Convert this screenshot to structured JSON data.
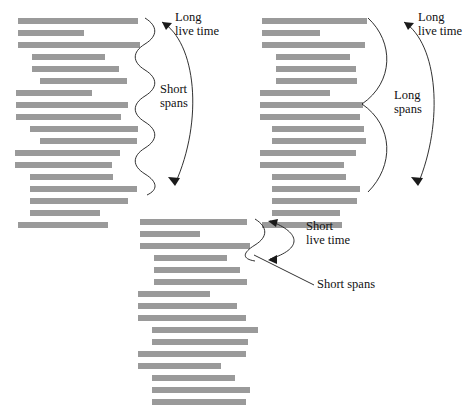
{
  "figure": {
    "background_color": "#ffffff",
    "bar_color": "#9a9a9a",
    "line_color": "#1a1a1a",
    "text_color": "#111111"
  },
  "panels": [
    {
      "id": "panel-long-short",
      "name": "long-live-time-short-spans",
      "annotations": {
        "live_time_line1": "Long",
        "live_time_line2": "live time",
        "spans_line1": "Short",
        "spans_line2": "spans"
      },
      "bars": [
        {
          "x": 18,
          "y": 18,
          "w": 120
        },
        {
          "x": 18,
          "y": 30,
          "w": 66
        },
        {
          "x": 18,
          "y": 42,
          "w": 122
        },
        {
          "x": 32,
          "y": 54,
          "w": 73
        },
        {
          "x": 32,
          "y": 66,
          "w": 87
        },
        {
          "x": 40,
          "y": 78,
          "w": 87
        },
        {
          "x": 16,
          "y": 90,
          "w": 76
        },
        {
          "x": 16,
          "y": 102,
          "w": 112
        },
        {
          "x": 16,
          "y": 114,
          "w": 105
        },
        {
          "x": 30,
          "y": 126,
          "w": 108
        },
        {
          "x": 40,
          "y": 138,
          "w": 97
        },
        {
          "x": 15,
          "y": 150,
          "w": 105
        },
        {
          "x": 15,
          "y": 162,
          "w": 97
        },
        {
          "x": 30,
          "y": 174,
          "w": 83
        },
        {
          "x": 30,
          "y": 186,
          "w": 107
        },
        {
          "x": 30,
          "y": 198,
          "w": 98
        },
        {
          "x": 30,
          "y": 210,
          "w": 70
        },
        {
          "x": 18,
          "y": 222,
          "w": 90
        }
      ]
    },
    {
      "id": "panel-long-long",
      "name": "long-live-time-long-spans",
      "annotations": {
        "live_time_line1": "Long",
        "live_time_line2": "live time",
        "spans_line1": "Long",
        "spans_line2": "spans"
      },
      "bars": [
        {
          "x": 14,
          "y": 18,
          "w": 105
        },
        {
          "x": 14,
          "y": 30,
          "w": 58
        },
        {
          "x": 14,
          "y": 42,
          "w": 103
        },
        {
          "x": 28,
          "y": 54,
          "w": 74
        },
        {
          "x": 28,
          "y": 66,
          "w": 80
        },
        {
          "x": 28,
          "y": 78,
          "w": 81
        },
        {
          "x": 12,
          "y": 90,
          "w": 70
        },
        {
          "x": 12,
          "y": 102,
          "w": 103
        },
        {
          "x": 12,
          "y": 114,
          "w": 100
        },
        {
          "x": 24,
          "y": 126,
          "w": 92
        },
        {
          "x": 24,
          "y": 138,
          "w": 94
        },
        {
          "x": 12,
          "y": 150,
          "w": 96
        },
        {
          "x": 12,
          "y": 162,
          "w": 84
        },
        {
          "x": 24,
          "y": 174,
          "w": 74
        },
        {
          "x": 24,
          "y": 186,
          "w": 88
        },
        {
          "x": 24,
          "y": 198,
          "w": 85
        },
        {
          "x": 24,
          "y": 210,
          "w": 68
        },
        {
          "x": 14,
          "y": 222,
          "w": 80
        }
      ]
    },
    {
      "id": "panel-short-short",
      "name": "short-live-time-short-spans",
      "annotations": {
        "live_time_line1": "Short",
        "live_time_line2": "live time",
        "spans_line1": "Short spans"
      },
      "bars": [
        {
          "x": 22,
          "y": 14,
          "w": 107
        },
        {
          "x": 22,
          "y": 26,
          "w": 60
        },
        {
          "x": 22,
          "y": 38,
          "w": 110
        },
        {
          "x": 36,
          "y": 50,
          "w": 73
        },
        {
          "x": 36,
          "y": 62,
          "w": 86
        },
        {
          "x": 36,
          "y": 74,
          "w": 93
        },
        {
          "x": 20,
          "y": 86,
          "w": 72
        },
        {
          "x": 20,
          "y": 98,
          "w": 99
        },
        {
          "x": 20,
          "y": 110,
          "w": 108
        },
        {
          "x": 34,
          "y": 122,
          "w": 106
        },
        {
          "x": 34,
          "y": 134,
          "w": 96
        },
        {
          "x": 20,
          "y": 146,
          "w": 108
        },
        {
          "x": 20,
          "y": 158,
          "w": 83
        },
        {
          "x": 34,
          "y": 170,
          "w": 83
        },
        {
          "x": 34,
          "y": 182,
          "w": 98
        },
        {
          "x": 34,
          "y": 194,
          "w": 94
        },
        {
          "x": 34,
          "y": 206,
          "w": 72
        },
        {
          "x": 20,
          "y": 218,
          "w": 90
        }
      ]
    }
  ]
}
